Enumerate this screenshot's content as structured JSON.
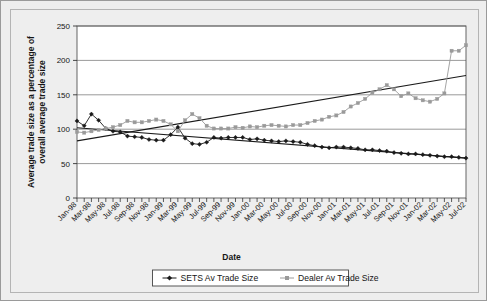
{
  "chart_data": {
    "type": "line",
    "title": "",
    "xlabel": "Date",
    "ylabel": "Average trade size as a percentage of overall average trade size",
    "ylim": [
      0,
      250
    ],
    "yticks": [
      0,
      50,
      100,
      150,
      200,
      250
    ],
    "grid": true,
    "legend_position": "bottom",
    "x": [
      "Jan-98",
      "Feb-98",
      "Mar-98",
      "Apr-98",
      "May-98",
      "Jun-98",
      "Jul-98",
      "Aug-98",
      "Sep-98",
      "Oct-98",
      "Nov-98",
      "Dec-98",
      "Jan-99",
      "Feb-99",
      "Mar-99",
      "Apr-99",
      "May-99",
      "Jun-99",
      "Jul-99",
      "Aug-99",
      "Sep-99",
      "Oct-99",
      "Nov-99",
      "Dec-99",
      "Jan-00",
      "Feb-00",
      "Mar-00",
      "Apr-00",
      "May-00",
      "Jun-00",
      "Jul-00",
      "Aug-00",
      "Sep-00",
      "Oct-00",
      "Nov-00",
      "Dec-00",
      "Jan-01",
      "Feb-01",
      "Mar-01",
      "Apr-01",
      "May-01",
      "Jun-01",
      "Jul-01",
      "Aug-01",
      "Sep-01",
      "Oct-01",
      "Nov-01",
      "Dec-01",
      "Jan-02",
      "Feb-02",
      "Mar-02",
      "Apr-02",
      "May-02",
      "Jun-02",
      "Jul-02"
    ],
    "xtick_labels": [
      "Jan-98",
      "Mar-98",
      "May-98",
      "Jul-98",
      "Sep-98",
      "Nov-98",
      "Jan-99",
      "Mar-99",
      "May-99",
      "Jul-99",
      "Sep-99",
      "Nov-99",
      "Jan-00",
      "Mar-00",
      "May-00",
      "Jul-00",
      "Sep-00",
      "Nov-00",
      "Jan-01",
      "Mar-01",
      "May-01",
      "Jul-01",
      "Sep-01",
      "Nov-01",
      "Jan-02",
      "Mar-02",
      "May-02",
      "Jul-02"
    ],
    "series": [
      {
        "name": "SETS Av Trade Size",
        "color": "#1a1a1a",
        "marker": "diamond",
        "values": [
          112,
          105,
          122,
          113,
          101,
          97,
          96,
          90,
          89,
          88,
          85,
          84,
          84,
          92,
          103,
          87,
          79,
          78,
          81,
          88,
          87,
          88,
          88,
          88,
          85,
          86,
          84,
          83,
          82,
          83,
          82,
          81,
          78,
          76,
          74,
          73,
          74,
          74,
          73,
          72,
          70,
          70,
          69,
          68,
          66,
          65,
          64,
          64,
          63,
          62,
          61,
          60,
          60,
          59,
          58
        ]
      },
      {
        "name": "Dealer Av Trade Size",
        "color": "#9a9a9a",
        "marker": "square",
        "values": [
          96,
          95,
          97,
          99,
          101,
          103,
          106,
          112,
          110,
          110,
          112,
          114,
          112,
          107,
          97,
          113,
          122,
          116,
          105,
          101,
          101,
          101,
          103,
          102,
          104,
          103,
          105,
          106,
          105,
          104,
          106,
          106,
          109,
          112,
          114,
          118,
          120,
          125,
          133,
          138,
          144,
          153,
          158,
          164,
          158,
          148,
          152,
          145,
          142,
          140,
          144,
          152,
          214,
          214,
          222
        ]
      }
    ],
    "trendlines": [
      {
        "name": "SETS trend",
        "from": [
          0,
          102
        ],
        "to": [
          54,
          58
        ],
        "color": "#1a1a1a"
      },
      {
        "name": "Dealer trend",
        "from": [
          0,
          83
        ],
        "to": [
          54,
          178
        ],
        "color": "#1a1a1a"
      }
    ]
  },
  "legend": {
    "items": [
      {
        "label": "SETS Av Trade Size",
        "marker": "diamond",
        "color": "#1a1a1a"
      },
      {
        "label": "Dealer Av Trade Size",
        "marker": "square",
        "color": "#9a9a9a"
      }
    ]
  }
}
